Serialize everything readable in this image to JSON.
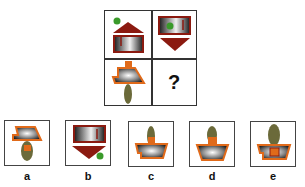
{
  "puzzle": {
    "grid": {
      "cells": [
        {
          "position": "top-left",
          "content": "house-roof-up-with-green-dot"
        },
        {
          "position": "top-right",
          "content": "box-with-down-triangle-green-dot-inside"
        },
        {
          "position": "bottom-left",
          "content": "trapezoid-with-olive-stem-down"
        },
        {
          "position": "bottom-right",
          "content": "question",
          "text": "?"
        }
      ]
    },
    "options": [
      {
        "label": "a",
        "content": "trapezoid-with-stem-down"
      },
      {
        "label": "b",
        "content": "box-with-down-triangle-green-dot-outside"
      },
      {
        "label": "c",
        "content": "trapezoid-with-stem-up-small"
      },
      {
        "label": "d",
        "content": "trapezoid-with-stem-up"
      },
      {
        "label": "e",
        "content": "trapezoid-with-stem-up-large"
      }
    ],
    "colors": {
      "dark_red": "#8b1a10",
      "orange": "#e06a1a",
      "olive": "#6b6a3a",
      "green": "#3a9a2a",
      "metal_light": "#f2f2f2",
      "metal_dark": "#222222"
    }
  }
}
